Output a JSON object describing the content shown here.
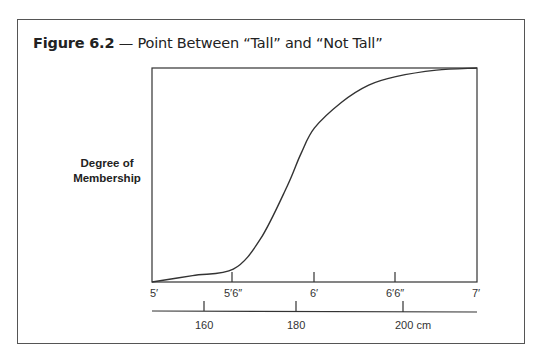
{
  "figure": {
    "number_label": "Figure 6.2",
    "dash": " — ",
    "caption": "Point Between “Tall” and “Not Tall”"
  },
  "axes": {
    "ylabel_line1": "Degree of",
    "ylabel_line2": "Membership",
    "feet_ticks": [
      "5′",
      "5′6″",
      "6′",
      "6′6″",
      "7′"
    ],
    "cm_ticks": [
      "160",
      "180",
      "200 cm"
    ]
  },
  "chart_data": {
    "type": "line",
    "title": "Figure 6.2 — Point Between “Tall” and “Not Tall”",
    "xlabel": "Height",
    "ylabel": "Degree of Membership",
    "x_axes": [
      {
        "name": "feet",
        "ticks": [
          "5′",
          "5′6″",
          "6′",
          "6′6″",
          "7′"
        ],
        "range_inches": [
          60,
          84
        ]
      },
      {
        "name": "cm",
        "ticks": [
          "160",
          "180",
          "200 cm"
        ]
      }
    ],
    "ylim": [
      0,
      1
    ],
    "grid": false,
    "legend": null,
    "series": [
      {
        "name": "Membership in “Tall”",
        "x_inches": [
          60,
          63,
          66,
          68,
          70,
          71,
          72,
          74,
          76,
          78,
          81,
          84
        ],
        "values": [
          0.0,
          0.03,
          0.06,
          0.2,
          0.45,
          0.6,
          0.72,
          0.84,
          0.92,
          0.96,
          0.99,
          1.0
        ]
      }
    ],
    "annotations": []
  }
}
